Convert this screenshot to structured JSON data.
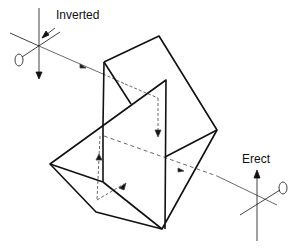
{
  "diagram": {
    "type": "prism optical path",
    "labels": {
      "input": "Inverted",
      "output": "Erect"
    },
    "colors": {
      "line": "#111111",
      "dashed": "#777777",
      "background": "#ffffff"
    }
  }
}
